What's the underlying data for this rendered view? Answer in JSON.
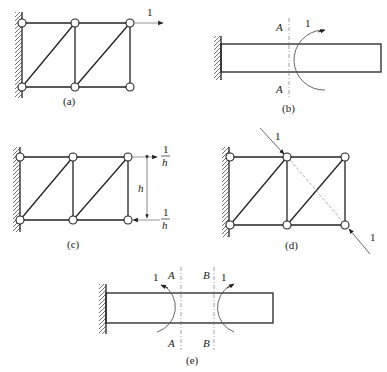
{
  "figures": {
    "a": {
      "caption": "(a)",
      "force_label": "1"
    },
    "b": {
      "caption": "(b)",
      "section_top": "A",
      "section_bottom": "A",
      "moment_label": "1"
    },
    "c": {
      "caption": "(c)",
      "force_top_num": "1",
      "force_top_den": "h",
      "force_bottom_num": "1",
      "force_bottom_den": "h",
      "height_label": "h"
    },
    "d": {
      "caption": "(d)",
      "force_top_label": "1",
      "force_bottom_label": "1"
    },
    "e": {
      "caption": "(e)",
      "section_a_top": "A",
      "section_a_bottom": "A",
      "section_b_top": "B",
      "section_b_bottom": "B",
      "moment_left_label": "1",
      "moment_right_label": "1"
    }
  },
  "colors": {
    "line": "#222222",
    "dashed": "#777777",
    "background": "#ffffff"
  }
}
